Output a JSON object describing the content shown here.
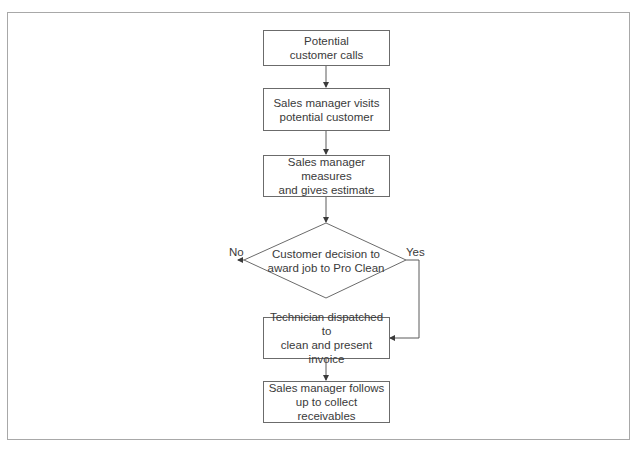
{
  "diagram": {
    "type": "flowchart",
    "nodes": [
      {
        "id": "n1",
        "shape": "process",
        "label": "Potential\ncustomer calls"
      },
      {
        "id": "n2",
        "shape": "process",
        "label": "Sales manager visits\npotential customer"
      },
      {
        "id": "n3",
        "shape": "process",
        "label": "Sales manager measures\nand gives estimate"
      },
      {
        "id": "n4",
        "shape": "decision",
        "label": "Customer decision to\naward job to Pro Clean"
      },
      {
        "id": "n5",
        "shape": "process",
        "label": "Technician dispatched to\nclean and present\ninvoice"
      },
      {
        "id": "n6",
        "shape": "process",
        "label": "Sales manager follows\nup to collect receivables"
      }
    ],
    "edges": [
      {
        "from": "n1",
        "to": "n2",
        "label": ""
      },
      {
        "from": "n2",
        "to": "n3",
        "label": ""
      },
      {
        "from": "n3",
        "to": "n4",
        "label": ""
      },
      {
        "from": "n4",
        "to": "exit-left",
        "label": "No"
      },
      {
        "from": "n4",
        "to": "n5",
        "label": "Yes"
      },
      {
        "from": "n5",
        "to": "n6",
        "label": ""
      }
    ],
    "branch_labels": {
      "no": "No",
      "yes": "Yes"
    },
    "colors": {
      "line": "#5a5a5a",
      "box_border": "#6b6b6b",
      "frame_border": "#a8a8a8",
      "text": "#3a3a3a"
    }
  }
}
